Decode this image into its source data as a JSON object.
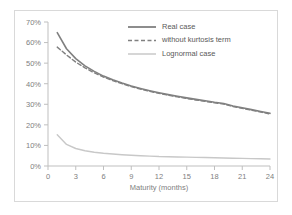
{
  "chart_data": {
    "type": "line",
    "title": "",
    "xlabel": "Maturity (months)",
    "ylabel": "",
    "xlim": [
      0,
      24
    ],
    "ylim": [
      0,
      0.7
    ],
    "xticks": [
      0,
      3,
      6,
      9,
      12,
      15,
      18,
      21,
      24
    ],
    "xticklabels": [
      "0",
      "3",
      "6",
      "9",
      "12",
      "15",
      "18",
      "21",
      "24"
    ],
    "yticks": [
      0,
      0.1,
      0.2,
      0.3,
      0.4,
      0.5,
      0.6,
      0.7
    ],
    "yticklabels": [
      "0%",
      "10%",
      "20%",
      "30%",
      "40%",
      "50%",
      "60%",
      "70%"
    ],
    "grid": false,
    "legend_position": "upper-right-inside",
    "x": [
      1,
      2,
      3,
      4,
      5,
      6,
      7,
      8,
      9,
      10,
      11,
      12,
      13,
      14,
      15,
      16,
      17,
      18,
      19,
      20,
      21,
      22,
      23,
      24
    ],
    "series": [
      {
        "name": "Real case",
        "style": "solid",
        "color": "#808080",
        "width": 1.6,
        "values": [
          0.648,
          0.57,
          0.522,
          0.487,
          0.46,
          0.437,
          0.419,
          0.403,
          0.389,
          0.377,
          0.366,
          0.356,
          0.347,
          0.339,
          0.331,
          0.324,
          0.317,
          0.31,
          0.304,
          0.292,
          0.283,
          0.274,
          0.265,
          0.256
        ]
      },
      {
        "name": "without kurtosis term",
        "style": "dashed",
        "color": "#808080",
        "width": 1.4,
        "values": [
          0.578,
          0.54,
          0.505,
          0.477,
          0.453,
          0.432,
          0.415,
          0.4,
          0.386,
          0.374,
          0.363,
          0.353,
          0.344,
          0.336,
          0.328,
          0.321,
          0.314,
          0.307,
          0.301,
          0.289,
          0.28,
          0.271,
          0.262,
          0.253
        ]
      },
      {
        "name": "Lognormal case",
        "style": "solid",
        "color": "#c8c8c8",
        "width": 1.4,
        "values": [
          0.152,
          0.105,
          0.085,
          0.074,
          0.067,
          0.062,
          0.058,
          0.055,
          0.052,
          0.05,
          0.048,
          0.046,
          0.045,
          0.044,
          0.043,
          0.042,
          0.041,
          0.04,
          0.039,
          0.038,
          0.037,
          0.036,
          0.035,
          0.034
        ]
      }
    ]
  },
  "legend": {
    "entries": [
      {
        "label": "Real case",
        "style": "solid",
        "color": "#808080"
      },
      {
        "label": "without kurtosis term",
        "style": "dashed",
        "color": "#808080"
      },
      {
        "label": "Lognormal case",
        "style": "solid",
        "color": "#c8c8c8"
      }
    ]
  },
  "axes": {
    "x_title": "Maturity (months)"
  },
  "colors": {
    "frame": "#d9d9d9",
    "axis": "#bfbfbf",
    "tick_text": "#808080",
    "legend_text": "#595959",
    "series_dark": "#808080",
    "series_light": "#c8c8c8",
    "background": "#ffffff"
  }
}
